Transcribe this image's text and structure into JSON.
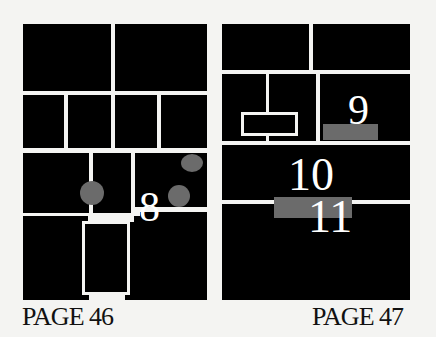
{
  "pages": [
    {
      "label": "PAGE 46",
      "panel_numbers": [
        "8"
      ],
      "markers": [
        {
          "type": "circle",
          "color": "#6b6b6b"
        },
        {
          "type": "circle",
          "color": "#6b6b6b"
        },
        {
          "type": "circle",
          "color": "#6b6b6b"
        }
      ]
    },
    {
      "label": "PAGE 47",
      "panel_numbers": [
        "9",
        "10",
        "11"
      ],
      "markers": [
        {
          "type": "bar",
          "color": "#6b6b6b"
        },
        {
          "type": "bar",
          "color": "#6b6b6b"
        }
      ]
    }
  ],
  "colors": {
    "panel": "#000000",
    "gutter": "#f4f4f2",
    "marker": "#6b6b6b",
    "number": "#ffffff"
  }
}
